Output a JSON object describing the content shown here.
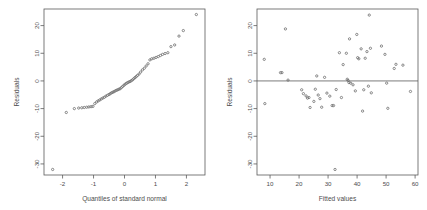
{
  "figure": {
    "background": "#ffffff",
    "point_color": "#666666",
    "axis_color": "#5a5a5a",
    "text_color": "#4d4d4d"
  },
  "chart_data": [
    {
      "type": "scatter",
      "name": "normal-qq-plot",
      "title": "",
      "xlabel": "Quantiles of standard normal",
      "ylabel": "Residuals",
      "xlim": [
        -2.6,
        2.6
      ],
      "ylim": [
        -34,
        26
      ],
      "xticks": [
        -2,
        -1,
        0,
        1,
        2
      ],
      "xticklabels": [
        "-2",
        "-1",
        "0",
        "1",
        "2"
      ],
      "yticks": [
        -30,
        -20,
        -10,
        0,
        10,
        20
      ],
      "yticklabels": [
        "-30",
        "-20",
        "-10",
        "0",
        "10",
        "20"
      ],
      "grid": false,
      "legend": false,
      "y_tick_rotation": 90,
      "points": [
        [
          -2.32,
          -32.0
        ],
        [
          -1.88,
          -11.4
        ],
        [
          -1.62,
          -10.0
        ],
        [
          -1.48,
          -9.8
        ],
        [
          -1.38,
          -9.7
        ],
        [
          -1.3,
          -9.6
        ],
        [
          -1.22,
          -9.5
        ],
        [
          -1.15,
          -9.4
        ],
        [
          -1.08,
          -9.3
        ],
        [
          -1.02,
          -9.2
        ],
        [
          -0.96,
          -8.2
        ],
        [
          -0.9,
          -7.6
        ],
        [
          -0.85,
          -7.2
        ],
        [
          -0.8,
          -6.9
        ],
        [
          -0.75,
          -6.5
        ],
        [
          -0.7,
          -6.2
        ],
        [
          -0.65,
          -5.9
        ],
        [
          -0.6,
          -5.5
        ],
        [
          -0.55,
          -5.2
        ],
        [
          -0.5,
          -4.9
        ],
        [
          -0.46,
          -4.6
        ],
        [
          -0.42,
          -4.3
        ],
        [
          -0.38,
          -4.1
        ],
        [
          -0.34,
          -3.9
        ],
        [
          -0.3,
          -3.6
        ],
        [
          -0.26,
          -3.4
        ],
        [
          -0.22,
          -3.2
        ],
        [
          -0.18,
          -3.0
        ],
        [
          -0.14,
          -2.8
        ],
        [
          -0.1,
          -2.4
        ],
        [
          -0.06,
          -2.0
        ],
        [
          -0.02,
          -1.6
        ],
        [
          0.02,
          -1.2
        ],
        [
          0.06,
          -0.9
        ],
        [
          0.1,
          -0.6
        ],
        [
          0.14,
          -0.4
        ],
        [
          0.18,
          -0.2
        ],
        [
          0.22,
          0.1
        ],
        [
          0.26,
          0.4
        ],
        [
          0.3,
          0.8
        ],
        [
          0.34,
          1.2
        ],
        [
          0.38,
          1.6
        ],
        [
          0.42,
          2.0
        ],
        [
          0.47,
          2.5
        ],
        [
          0.52,
          3.2
        ],
        [
          0.58,
          4.0
        ],
        [
          0.64,
          4.6
        ],
        [
          0.7,
          5.4
        ],
        [
          0.76,
          6.2
        ],
        [
          0.82,
          7.6
        ],
        [
          0.88,
          8.0
        ],
        [
          0.95,
          8.2
        ],
        [
          1.02,
          8.5
        ],
        [
          1.09,
          8.8
        ],
        [
          1.16,
          9.2
        ],
        [
          1.23,
          9.6
        ],
        [
          1.31,
          9.9
        ],
        [
          1.4,
          10.2
        ],
        [
          1.5,
          12.4
        ],
        [
          1.62,
          13.0
        ],
        [
          1.76,
          16.2
        ],
        [
          1.9,
          18.2
        ],
        [
          2.32,
          24.0
        ]
      ]
    },
    {
      "type": "scatter",
      "name": "residuals-vs-fitted-plot",
      "title": "",
      "xlabel": "Fitted values",
      "ylabel": "Residuals",
      "xlim": [
        5.5,
        61
      ],
      "ylim": [
        -34,
        26
      ],
      "xticks": [
        10,
        20,
        30,
        40,
        50,
        60
      ],
      "xticklabels": [
        "10",
        "20",
        "30",
        "40",
        "50",
        "60"
      ],
      "yticks": [
        -30,
        -20,
        -10,
        0,
        10,
        20
      ],
      "yticklabels": [
        "-30",
        "-20",
        "-10",
        "0",
        "10",
        "20"
      ],
      "grid": false,
      "legend": false,
      "y_tick_rotation": 90,
      "reference_line_y": 0,
      "points": [
        [
          8.0,
          7.8
        ],
        [
          8.2,
          -8.2
        ],
        [
          13.6,
          3.0
        ],
        [
          14.1,
          3.0
        ],
        [
          15.3,
          18.8
        ],
        [
          16.2,
          0.3
        ],
        [
          20.9,
          -3.2
        ],
        [
          21.5,
          -4.6
        ],
        [
          22.4,
          -5.4
        ],
        [
          22.9,
          -6.2
        ],
        [
          23.4,
          -6.0
        ],
        [
          23.8,
          -9.6
        ],
        [
          25.1,
          -7.4
        ],
        [
          25.6,
          -3.0
        ],
        [
          26.1,
          1.8
        ],
        [
          26.6,
          -5.1
        ],
        [
          27.2,
          -6.4
        ],
        [
          27.8,
          -9.5
        ],
        [
          28.8,
          1.3
        ],
        [
          29.6,
          -4.4
        ],
        [
          30.6,
          -5.5
        ],
        [
          31.4,
          -8.9
        ],
        [
          31.9,
          -8.9
        ],
        [
          32.4,
          -32.0
        ],
        [
          32.8,
          -3.1
        ],
        [
          33.9,
          10.2
        ],
        [
          34.6,
          -6.0
        ],
        [
          35.2,
          5.9
        ],
        [
          36.3,
          10.0
        ],
        [
          36.6,
          0.6
        ],
        [
          36.9,
          0.2
        ],
        [
          37.2,
          -0.6
        ],
        [
          37.4,
          15.2
        ],
        [
          37.8,
          -0.8
        ],
        [
          38.6,
          -1.4
        ],
        [
          39.4,
          -3.6
        ],
        [
          39.9,
          16.8
        ],
        [
          40.2,
          8.4
        ],
        [
          40.6,
          8.0
        ],
        [
          41.4,
          11.6
        ],
        [
          41.9,
          -10.9
        ],
        [
          42.3,
          -3.2
        ],
        [
          42.8,
          8.2
        ],
        [
          43.4,
          10.6
        ],
        [
          43.9,
          -1.9
        ],
        [
          44.2,
          23.8
        ],
        [
          44.6,
          11.8
        ],
        [
          44.9,
          -4.3
        ],
        [
          48.4,
          12.6
        ],
        [
          49.6,
          9.6
        ],
        [
          50.2,
          -0.8
        ],
        [
          50.6,
          -9.9
        ],
        [
          52.8,
          4.5
        ],
        [
          53.4,
          6.0
        ],
        [
          55.8,
          5.7
        ],
        [
          58.4,
          -3.8
        ]
      ]
    }
  ]
}
